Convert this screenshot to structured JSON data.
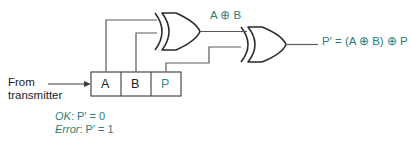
{
  "diagram": {
    "colors": {
      "wire": "#4a4a4a",
      "gate_outline": "#2b2b2b",
      "box_outline": "#4a4a4a",
      "teal_text": "#2e7d74",
      "dark_text": "#1c1c1c",
      "background": "#ffffff"
    },
    "source_label": {
      "line1": "From",
      "line2": "transmitter"
    },
    "frame": {
      "name": "received-frame",
      "cells": [
        {
          "label": "A",
          "color": "#1c1c1c"
        },
        {
          "label": "B",
          "color": "#1c1c1c"
        },
        {
          "label": "P",
          "color": "#2e9182"
        }
      ]
    },
    "gates": [
      {
        "name": "xor-gate-1",
        "type": "XOR",
        "inputs": [
          "A",
          "B"
        ],
        "output_label": "A ⊕ B"
      },
      {
        "name": "xor-gate-2",
        "type": "XOR",
        "inputs": [
          "A ⊕ B",
          "P"
        ],
        "output_label": "P′ = (A ⊕ B) ⊕ P"
      }
    ],
    "labels": {
      "intermediate": "A ⊕ B",
      "output": "P′ = (A ⊕ B) ⊕ P"
    },
    "legend": [
      {
        "term": "OK",
        "sep": ": ",
        "expr": "P′ = 0"
      },
      {
        "term": "Error",
        "sep": ": ",
        "expr": "P′ = 1"
      }
    ]
  }
}
